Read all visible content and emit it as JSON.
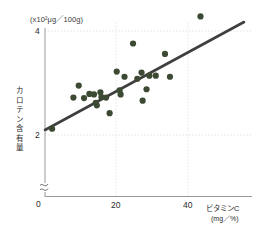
{
  "chart_data": {
    "type": "scatter",
    "title": "",
    "xlabel": "ビタミンC",
    "xunit": "(mg／%)",
    "ylabel": "カロテン含有量",
    "yunit": "(x10²μg／100g)",
    "xlim": [
      0,
      46
    ],
    "ylim": [
      0,
      4.35
    ],
    "xticks": [
      0,
      20,
      40
    ],
    "xticklabels": [
      "0",
      "20",
      "40"
    ],
    "yticks": [
      2,
      4
    ],
    "yticklabels": [
      "2",
      "4"
    ],
    "grid": "dotted-light",
    "y_axis_break": true,
    "legend": "none",
    "point_color": "#3d4a33",
    "line_color": "#3f3f3f",
    "points": [
      {
        "x": 2.0,
        "y": 2.12
      },
      {
        "x": 8.0,
        "y": 2.72
      },
      {
        "x": 9.5,
        "y": 2.95
      },
      {
        "x": 11.0,
        "y": 2.71
      },
      {
        "x": 12.5,
        "y": 2.79
      },
      {
        "x": 13.8,
        "y": 2.78
      },
      {
        "x": 14.3,
        "y": 2.62
      },
      {
        "x": 14.6,
        "y": 2.57
      },
      {
        "x": 15.6,
        "y": 2.82
      },
      {
        "x": 15.9,
        "y": 2.73
      },
      {
        "x": 17.2,
        "y": 2.72
      },
      {
        "x": 18.2,
        "y": 2.42
      },
      {
        "x": 20.2,
        "y": 3.22
      },
      {
        "x": 21.0,
        "y": 2.86
      },
      {
        "x": 21.3,
        "y": 2.78
      },
      {
        "x": 22.4,
        "y": 3.12
      },
      {
        "x": 24.8,
        "y": 3.76
      },
      {
        "x": 26.0,
        "y": 3.08
      },
      {
        "x": 27.2,
        "y": 3.2
      },
      {
        "x": 27.5,
        "y": 2.66
      },
      {
        "x": 28.6,
        "y": 2.88
      },
      {
        "x": 29.4,
        "y": 3.14
      },
      {
        "x": 31.2,
        "y": 3.14
      },
      {
        "x": 33.8,
        "y": 3.56
      },
      {
        "x": 35.2,
        "y": 3.12
      },
      {
        "x": 43.8,
        "y": 4.28
      }
    ],
    "trendline": {
      "x0": 0.0,
      "y0": 2.27,
      "x1": 45.5,
      "y1": 4.1
    }
  },
  "caption": {
    "text": ""
  }
}
